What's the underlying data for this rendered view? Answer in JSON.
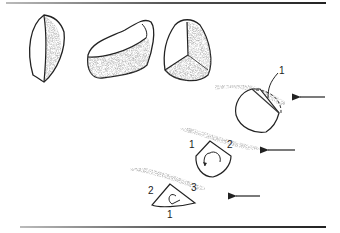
{
  "figure": {
    "type": "illustration",
    "stones": [
      {
        "name": "lens-shaped stone"
      },
      {
        "name": "elongated faceted stone"
      },
      {
        "name": "three-faceted stone"
      }
    ],
    "panels": [
      {
        "name": "stage-1",
        "labels": [
          "1"
        ]
      },
      {
        "name": "stage-2",
        "labels": [
          "1",
          "2"
        ]
      },
      {
        "name": "stage-3",
        "labels": [
          "2",
          "3",
          "1"
        ]
      }
    ],
    "colors": {
      "ink": "#222222",
      "sand": "#9a9a9a",
      "rule": "#444444"
    }
  }
}
